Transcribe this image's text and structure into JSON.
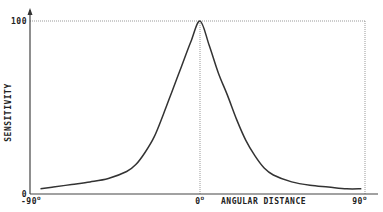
{
  "chart_data": {
    "type": "line",
    "title": "",
    "xlabel": "ANGULAR DISTANCE",
    "ylabel": "SENSITIVITY",
    "xlim": [
      -90,
      90
    ],
    "ylim": [
      0,
      100
    ],
    "x_ticks": [
      {
        "value": -90,
        "label": "-90",
        "degree": "o"
      },
      {
        "value": 0,
        "label": "0",
        "degree": "o"
      },
      {
        "value": 90,
        "label": "90",
        "degree": "o"
      }
    ],
    "y_ticks": [
      {
        "value": 0,
        "label": "0"
      },
      {
        "value": 100,
        "label": "100"
      }
    ],
    "grid": false,
    "reference_lines": {
      "top_dotted_at_y": 100,
      "center_dotted_at_x": 0,
      "right_dotted_at_x": 90
    },
    "series": [
      {
        "name": "sensitivity",
        "color": "#333333",
        "x": [
          -87,
          -80,
          -70,
          -60,
          -50,
          -40,
          -35,
          -30,
          -25,
          -20,
          -15,
          -10,
          -5,
          0,
          5,
          10,
          15,
          20,
          25,
          30,
          35,
          40,
          50,
          60,
          70,
          80,
          88
        ],
        "y": [
          3,
          4,
          5.5,
          7,
          9,
          13,
          17,
          24,
          33,
          46,
          60,
          74,
          88,
          100,
          86,
          70,
          57,
          43,
          31,
          22,
          15,
          11,
          7,
          5,
          4,
          3,
          3
        ]
      }
    ]
  }
}
